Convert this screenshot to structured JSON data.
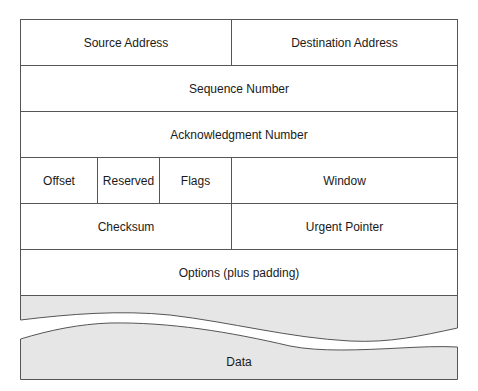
{
  "diagram": {
    "rows": [
      {
        "cells": [
          {
            "label": "Source Address"
          },
          {
            "label": "Destination Address"
          }
        ]
      },
      {
        "cells": [
          {
            "label": "Sequence Number"
          }
        ]
      },
      {
        "cells": [
          {
            "label": "Acknowledgment Number"
          }
        ]
      },
      {
        "cells": [
          {
            "label": "Offset"
          },
          {
            "label": "Reserved"
          },
          {
            "label": "Flags"
          },
          {
            "label": "Window"
          }
        ]
      },
      {
        "cells": [
          {
            "label": "Checksum"
          },
          {
            "label": "Urgent Pointer"
          }
        ]
      },
      {
        "cells": [
          {
            "label": "Options (plus padding)"
          }
        ]
      }
    ],
    "data_section": {
      "label": "Data",
      "fill_color": "#e6e6e6"
    },
    "border_color": "#555555"
  }
}
